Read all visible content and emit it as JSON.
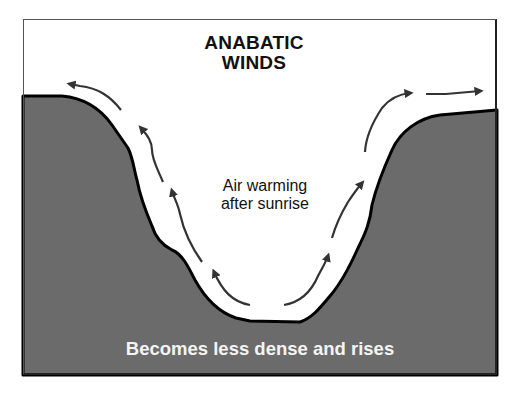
{
  "diagram": {
    "title_line1": "ANABATIC",
    "title_line2": "WINDS",
    "middle_label_line1": "Air warming",
    "middle_label_line2": "after sunrise",
    "bottom_label": "Becomes less dense and rises",
    "colors": {
      "background": "#ffffff",
      "sky": "#ffffff",
      "terrain": "#6b6b6b",
      "terrain_outline": "#000000",
      "arrow": "#333333",
      "title_text": "#111111",
      "bottom_text": "#f4f4f4"
    },
    "arrows": [
      {
        "side": "left",
        "position": "valley floor",
        "direction": "up-left"
      },
      {
        "side": "left",
        "position": "lower slope",
        "direction": "up"
      },
      {
        "side": "left",
        "position": "upper slope",
        "direction": "up"
      },
      {
        "side": "left",
        "position": "rim",
        "direction": "left"
      },
      {
        "side": "right",
        "position": "valley floor",
        "direction": "up-right"
      },
      {
        "side": "right",
        "position": "lower slope",
        "direction": "up"
      },
      {
        "side": "right",
        "position": "upper slope",
        "direction": "up-right"
      },
      {
        "side": "right",
        "position": "rim",
        "direction": "right"
      }
    ]
  }
}
